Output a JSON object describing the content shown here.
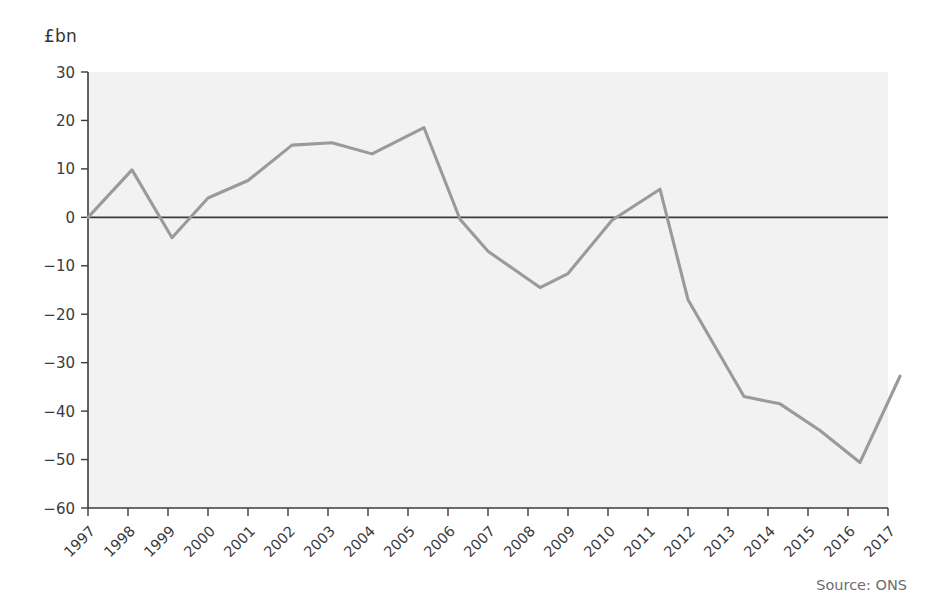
{
  "axis_label_y": "£bn",
  "source_note": "Source: ONS",
  "chart_data": {
    "type": "line",
    "title": "",
    "subtitle": "",
    "xlabel": "",
    "ylabel": "£bn",
    "ylim": [
      -60,
      30
    ],
    "xlim": [
      1997,
      2017
    ],
    "grid": false,
    "legend": "none",
    "zero_line": 0,
    "line_color": "#9a9a9a",
    "axis_color": "#3b3b3b",
    "plot_background": "#f2f2f2",
    "y_ticks": [
      30,
      20,
      10,
      0,
      -10,
      -20,
      -30,
      -40,
      -50,
      -60
    ],
    "y_tick_labels": [
      "30",
      "20",
      "10",
      "0",
      "−10",
      "−20",
      "−30",
      "−40",
      "−50",
      "−60"
    ],
    "x_ticks": [
      1997,
      1998,
      1999,
      2000,
      2001,
      2002,
      2003,
      2004,
      2005,
      2006,
      2007,
      2008,
      2009,
      2010,
      2011,
      2012,
      2013,
      2014,
      2015,
      2016,
      2017
    ],
    "x_tick_labels": [
      "1997",
      "1998",
      "1999",
      "2000",
      "2001",
      "2002",
      "2003",
      "2004",
      "2005",
      "2006",
      "2007",
      "2008",
      "2009",
      "2010",
      "2011",
      "2012",
      "2013",
      "2014",
      "2015",
      "2016",
      "2017"
    ],
    "x_tick_rotation": -45,
    "series": [
      {
        "name": "Balance",
        "color": "#9a9a9a",
        "x": [
          1997.0,
          1998.1,
          1999.1,
          2000.0,
          2001.0,
          2002.1,
          2003.1,
          2004.1,
          2005.4,
          2006.3,
          2007.0,
          2008.3,
          2009.0,
          2010.1,
          2011.3,
          2012.0,
          2013.4,
          2014.3,
          2015.3,
          2016.3,
          2017.3
        ],
        "y": [
          0.0,
          9.8,
          -4.2,
          4.0,
          7.6,
          14.9,
          15.4,
          13.1,
          18.5,
          -0.4,
          -7.0,
          -14.5,
          -11.6,
          -0.6,
          5.8,
          -17.0,
          -37.0,
          -38.5,
          -44.0,
          -50.6,
          -32.8
        ]
      }
    ]
  }
}
